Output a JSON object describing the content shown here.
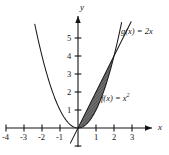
{
  "chart_data": {
    "type": "line",
    "title": "",
    "xlabel": "x",
    "ylabel": "y",
    "xlim": [
      -4.6,
      3.9
    ],
    "ylim": [
      -1.4,
      6.2
    ],
    "grid": false,
    "legend_position": "inline-annotations",
    "x_ticks": [
      -4,
      -3,
      -2,
      -1,
      1,
      2,
      3
    ],
    "y_ticks": [
      1,
      2,
      3,
      4,
      5
    ],
    "x_tick_labels": [
      "-4",
      "-3",
      "-2",
      "-1",
      "1",
      "2",
      "3"
    ],
    "y_tick_labels": [
      "1",
      "2",
      "3",
      "4",
      "5"
    ],
    "series": [
      {
        "name": "f(x) = x^2",
        "label": "f(x) = x",
        "label_exponent": "2",
        "type": "parabola",
        "equation": "y = x*x",
        "domain": [
          -2.4,
          2.42
        ],
        "color": "#1a1a1a"
      },
      {
        "name": "g(x) = 2x",
        "label": "g(x) = 2x",
        "type": "line",
        "equation": "y = 2*x",
        "domain": [
          -0.42,
          2.95
        ],
        "color": "#1a1a1a"
      }
    ],
    "shaded_region": {
      "description": "Region between g(x) = 2x and f(x) = x^2",
      "x_from": 0,
      "x_to": 2,
      "upper_curve": "g(x) = 2x",
      "lower_curve": "f(x) = x^2",
      "fill_color": "#6e6e6e",
      "area": 1.3333
    },
    "intersections": [
      {
        "x": 0,
        "y": 0
      },
      {
        "x": 2,
        "y": 4
      }
    ],
    "axis_color": "#141414",
    "annotations": [
      {
        "id": "g-label",
        "text": "g(x) = 2x",
        "x": 2.6,
        "y": 4.55
      },
      {
        "id": "f-label",
        "text": "f(x) = x",
        "exponent": "2",
        "x": 1.35,
        "y": 1.3
      }
    ]
  }
}
